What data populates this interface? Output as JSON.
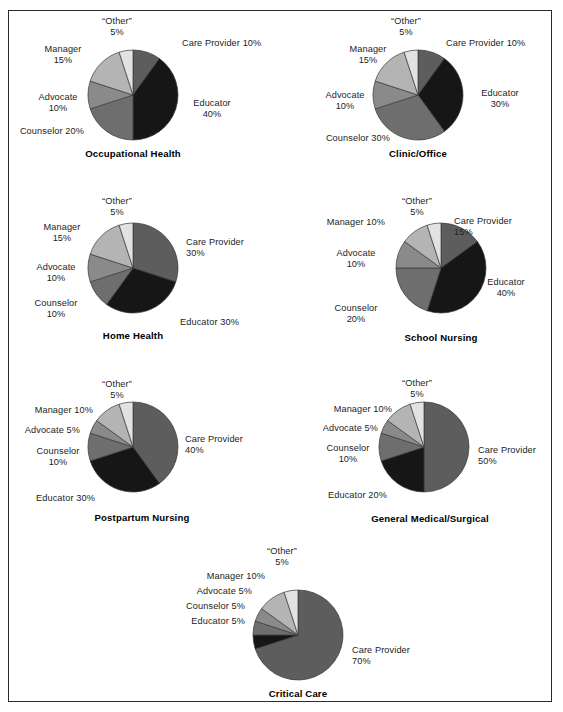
{
  "page": {
    "background": "#ffffff",
    "frame_color": "#2b2b2b"
  },
  "palette": {
    "care_provider": "#5d5d5d",
    "educator": "#161616",
    "counselor": "#6e6e6e",
    "advocate": "#8a8a8a",
    "manager": "#b4b4b4",
    "other": "#e2e2e2",
    "outline": "#3a3a3a"
  },
  "segment_order": [
    "Care Provider",
    "Educator",
    "Counselor",
    "Advocate",
    "Manager",
    "“Other”"
  ],
  "chart_data": [
    {
      "type": "pie",
      "title": "Occupational Health",
      "categories": [
        "Care Provider",
        "Educator",
        "Counselor",
        "Advocate",
        "Manager",
        "“Other”"
      ],
      "values": [
        10,
        40,
        20,
        10,
        15,
        5
      ],
      "labels": [
        "Care Provider 10%",
        "Educator\n40%",
        "Counselor 20%",
        "Advocate\n10%",
        "Manager\n15%",
        "“Other”\n5%"
      ],
      "cx": 133,
      "cy": 95,
      "r": 45,
      "title_x": 133,
      "title_y": 148,
      "label_pos": [
        {
          "x": 182,
          "y": 38,
          "align": "l"
        },
        {
          "x": 212,
          "y": 98,
          "align": "c"
        },
        {
          "x": 84,
          "y": 126,
          "align": "r"
        },
        {
          "x": 58,
          "y": 92,
          "align": "c"
        },
        {
          "x": 63,
          "y": 44,
          "align": "c"
        },
        {
          "x": 117,
          "y": 16,
          "align": "c"
        }
      ]
    },
    {
      "type": "pie",
      "title": "Clinic/Office",
      "categories": [
        "Care Provider",
        "Educator",
        "Counselor",
        "Advocate",
        "Manager",
        "“Other”"
      ],
      "values": [
        10,
        30,
        30,
        10,
        15,
        5
      ],
      "labels": [
        "Care Provider 10%",
        "Educator\n30%",
        "Counselor 30%",
        "Advocate\n10%",
        "Manager\n15%",
        "“Other”\n5%"
      ],
      "cx": 418,
      "cy": 95,
      "r": 45,
      "title_x": 418,
      "title_y": 148,
      "label_pos": [
        {
          "x": 446,
          "y": 38,
          "align": "l"
        },
        {
          "x": 500,
          "y": 88,
          "align": "c"
        },
        {
          "x": 390,
          "y": 133,
          "align": "r"
        },
        {
          "x": 345,
          "y": 90,
          "align": "c"
        },
        {
          "x": 368,
          "y": 44,
          "align": "c"
        },
        {
          "x": 406,
          "y": 16,
          "align": "c"
        }
      ]
    },
    {
      "type": "pie",
      "title": "Home Health",
      "categories": [
        "Care Provider",
        "Educator",
        "Counselor",
        "Advocate",
        "Manager",
        "“Other”"
      ],
      "values": [
        30,
        30,
        10,
        10,
        15,
        5
      ],
      "labels": [
        "Care Provider\n30%",
        "Educator 30%",
        "Counselor\n10%",
        "Advocate\n10%",
        "Manager\n15%",
        "“Other”\n5%"
      ],
      "cx": 133,
      "cy": 268,
      "r": 45,
      "title_x": 133,
      "title_y": 330,
      "label_pos": [
        {
          "x": 186,
          "y": 237,
          "align": "l"
        },
        {
          "x": 180,
          "y": 317,
          "align": "l"
        },
        {
          "x": 56,
          "y": 298,
          "align": "c"
        },
        {
          "x": 56,
          "y": 262,
          "align": "c"
        },
        {
          "x": 62,
          "y": 222,
          "align": "c"
        },
        {
          "x": 117,
          "y": 196,
          "align": "c"
        }
      ]
    },
    {
      "type": "pie",
      "title": "School Nursing",
      "categories": [
        "Care Provider",
        "Educator",
        "Counselor",
        "Advocate",
        "Manager",
        "“Other”"
      ],
      "values": [
        15,
        40,
        20,
        10,
        10,
        5
      ],
      "labels": [
        "Care Provider\n15%",
        "Educator\n40%",
        "Counselor\n20%",
        "Advocate\n10%",
        "Manager 10%",
        "“Other”\n5%"
      ],
      "cx": 441,
      "cy": 268,
      "r": 45,
      "title_x": 441,
      "title_y": 332,
      "label_pos": [
        {
          "x": 454,
          "y": 216,
          "align": "l"
        },
        {
          "x": 506,
          "y": 277,
          "align": "c"
        },
        {
          "x": 356,
          "y": 303,
          "align": "c"
        },
        {
          "x": 356,
          "y": 248,
          "align": "c"
        },
        {
          "x": 385,
          "y": 217,
          "align": "r"
        },
        {
          "x": 417,
          "y": 196,
          "align": "c"
        }
      ]
    },
    {
      "type": "pie",
      "title": "Postpartum Nursing",
      "categories": [
        "Care Provider",
        "Educator",
        "Counselor",
        "Advocate",
        "Manager",
        "“Other”"
      ],
      "values": [
        40,
        30,
        10,
        5,
        10,
        5
      ],
      "labels": [
        "Care Provider\n40%",
        "Educator 30%",
        "Counselor\n10%",
        "Advocate 5%",
        "Manager 10%",
        "“Other”\n5%"
      ],
      "cx": 133,
      "cy": 447,
      "r": 45,
      "title_x": 142,
      "title_y": 512,
      "label_pos": [
        {
          "x": 185,
          "y": 434,
          "align": "l"
        },
        {
          "x": 36,
          "y": 493,
          "align": "l"
        },
        {
          "x": 58,
          "y": 446,
          "align": "c"
        },
        {
          "x": 80,
          "y": 425,
          "align": "r"
        },
        {
          "x": 93,
          "y": 405,
          "align": "r"
        },
        {
          "x": 117,
          "y": 379,
          "align": "c"
        }
      ]
    },
    {
      "type": "pie",
      "title": "General Medical/Surgical",
      "categories": [
        "Care Provider",
        "Educator",
        "Counselor",
        "Advocate",
        "Manager",
        "“Other”"
      ],
      "values": [
        50,
        20,
        10,
        5,
        10,
        5
      ],
      "labels": [
        "Care Provider\n50%",
        "Educator 20%",
        "Counselor\n10%",
        "Advocate 5%",
        "Manager 10%",
        "“Other”\n5%"
      ],
      "cx": 424,
      "cy": 447,
      "r": 45,
      "title_x": 430,
      "title_y": 513,
      "label_pos": [
        {
          "x": 478,
          "y": 445,
          "align": "l"
        },
        {
          "x": 328,
          "y": 490,
          "align": "l"
        },
        {
          "x": 348,
          "y": 443,
          "align": "c"
        },
        {
          "x": 378,
          "y": 423,
          "align": "r"
        },
        {
          "x": 392,
          "y": 404,
          "align": "r"
        },
        {
          "x": 417,
          "y": 378,
          "align": "c"
        }
      ]
    },
    {
      "type": "pie",
      "title": "Critical Care",
      "categories": [
        "Care Provider",
        "Educator",
        "Counselor",
        "Advocate",
        "Manager",
        "“Other”"
      ],
      "values": [
        70,
        5,
        5,
        5,
        10,
        5
      ],
      "labels": [
        "Care Provider\n70%",
        "Educator 5%",
        "Counselor 5%",
        "Advocate 5%",
        "Manager 10%",
        "“Other”\n5%"
      ],
      "cx": 298,
      "cy": 635,
      "r": 45,
      "title_x": 298,
      "title_y": 688,
      "label_pos": [
        {
          "x": 352,
          "y": 645,
          "align": "l"
        },
        {
          "x": 245,
          "y": 616,
          "align": "r"
        },
        {
          "x": 245,
          "y": 601,
          "align": "r"
        },
        {
          "x": 252,
          "y": 586,
          "align": "r"
        },
        {
          "x": 265,
          "y": 571,
          "align": "r"
        },
        {
          "x": 282,
          "y": 546,
          "align": "c"
        }
      ]
    }
  ]
}
